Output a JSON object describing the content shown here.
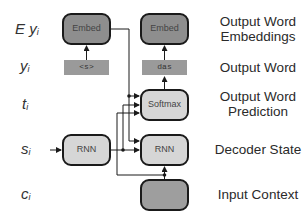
{
  "diagram": {
    "variables": {
      "embedding": {
        "main": "E y",
        "sub": "i"
      },
      "word": {
        "main": "y",
        "sub": "i"
      },
      "prediction": {
        "main": "t",
        "sub": "i"
      },
      "state": {
        "main": "s",
        "sub": "i"
      },
      "context": {
        "main": "c",
        "sub": "i"
      }
    },
    "right_labels": {
      "embeddings_line1": "Output Word",
      "embeddings_line2": "Embeddings",
      "word": "Output Word",
      "prediction_line1": "Output Word",
      "prediction_line2": "Prediction",
      "state": "Decoder State",
      "context": "Input Context"
    },
    "left_column": {
      "embed": "Embed",
      "word": "<s>",
      "rnn": "RNN"
    },
    "right_column": {
      "embed": "Embed",
      "word": "das",
      "softmax": "Softmax",
      "rnn": "RNN",
      "context": ""
    },
    "colors": {
      "dark_box": "#8e8e8e",
      "light_box": "#d6d6d6",
      "word_bar": "#9a9a9a",
      "stroke": "#1a1a1a"
    }
  }
}
